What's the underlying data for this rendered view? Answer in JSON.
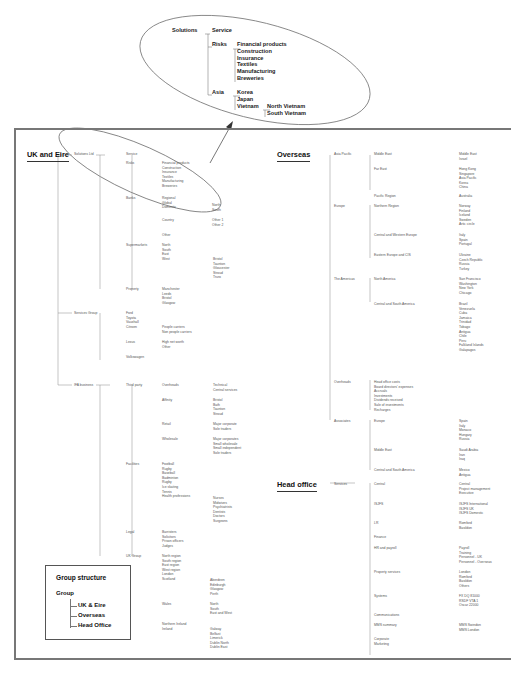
{
  "zoom_callout": {
    "root": "Solutions",
    "children": [
      {
        "label": "Service",
        "children": []
      },
      {
        "label": "Risks",
        "children": [
          "Financial products",
          "Construction",
          "Insurance",
          "Textiles",
          "Manufacturing",
          "Breweries"
        ]
      },
      {
        "label": "Asia",
        "children": [
          "Korea",
          "Japan",
          "Vietnam"
        ]
      }
    ],
    "vietnam_children": [
      "North Vietnam",
      "South Vietnam"
    ]
  },
  "uk": {
    "title": "UK and Eire",
    "l1": [
      "Solutions Ltd",
      "Services Group",
      "IFA business"
    ],
    "solutions": {
      "l2": [
        "Service",
        "Risks",
        "Banks",
        "Supermarkets",
        "Property"
      ],
      "risks": [
        "Financial products",
        "Construction",
        "Insurance",
        "Textiles",
        "Manufacturing",
        "Breweries"
      ],
      "banks_l3": [
        "Regional",
        "Global",
        "Domestic",
        "Country",
        "Other"
      ],
      "domestic": [
        "North",
        "South"
      ],
      "country": [
        "Other 1",
        "Other 2"
      ],
      "supermarkets": [
        "North",
        "South",
        "East",
        "West"
      ],
      "west": [
        "Bristol",
        "Taunton",
        "Gloucester",
        "Stroud",
        "Truro"
      ],
      "property": [
        "Manchester",
        "Leeds",
        "Bristol",
        "Glasgow"
      ]
    },
    "services_group": {
      "l2": [
        "Ford",
        "Toyota",
        "Vauxhall",
        "Citroen",
        "Lexus",
        "Volkswagen"
      ],
      "citroen": [
        "People carriers",
        "Non people carriers"
      ],
      "lexus": [
        "High net worth",
        "Other"
      ]
    },
    "ifa": {
      "l2": [
        "Third party",
        "Facilities",
        "Legal",
        "UK Group"
      ],
      "third_party": [
        "Overheads",
        "Affinity",
        "Retail",
        "Wholesale"
      ],
      "overheads": [
        "Technical",
        "Central services"
      ],
      "affinity": [
        "Bristol",
        "Bath",
        "Taunton",
        "Stroud"
      ],
      "retail": [
        "Major corporate",
        "Sole traders"
      ],
      "wholesale": [
        "Major corporates",
        "Small wholesale",
        "Small independent",
        "Sole traders"
      ],
      "facilities": [
        "Football",
        "Rugby",
        "Baseball",
        "Badminton",
        "Rugby",
        "Ice skating",
        "Tennis",
        "Health professions"
      ],
      "health": [
        "Nurses",
        "Midwives",
        "Psychiatrists",
        "Dentists",
        "Doctors",
        "Surgeons"
      ],
      "legal": [
        "Barristers",
        "Solicitors",
        "Prison officers",
        "Judges"
      ],
      "uk_group": [
        "North region",
        "South region",
        "East region",
        "West region",
        "London",
        "Scotland",
        "Wales",
        "Northern Ireland",
        "Ireland"
      ],
      "scotland": [
        "Aberdeen",
        "Edinburgh",
        "Glasgow",
        "Perth"
      ],
      "wales": [
        "North",
        "South",
        "East and West"
      ],
      "ireland": [
        "Galway",
        "Belfast",
        "Limerick",
        "Dublin North",
        "Dublin East"
      ]
    }
  },
  "overseas": {
    "title": "Overseas",
    "l1": [
      "Asia Pacific",
      "Europe",
      "The Americas",
      "Overheads",
      "Associates"
    ],
    "asia_pacific": {
      "l2": [
        "Middle East",
        "Far East",
        "Pacific Region"
      ],
      "middle_east": [
        "Middle East",
        "Israel"
      ],
      "far_east": [
        "Hong Kong",
        "Singapore",
        "Asia Pacific",
        "Korea",
        "China"
      ],
      "pacific": [
        "Australia"
      ]
    },
    "europe": {
      "l2": [
        "Northern Region",
        "Central and Western Europe",
        "Eastern Europe and CIS"
      ],
      "northern": [
        "Norway",
        "Finland",
        "Iceland",
        "Sweden",
        "Artic circle"
      ],
      "central": [
        "Italy",
        "Spain",
        "Portugal"
      ],
      "eastern": [
        "Ukraine",
        "Czech Republic",
        "Russia",
        "Turkey"
      ]
    },
    "americas": {
      "l2": [
        "North America",
        "Central and South America"
      ],
      "north": [
        "San Francisco",
        "Washington",
        "New York",
        "Chicago"
      ],
      "central_south": [
        "Brazil",
        "Venezuela",
        "Cuba",
        "Jamaica",
        "Trinidad",
        "Tobago",
        "Antigua",
        "Chile",
        "Peru",
        "Falkland Islands",
        "Galapagos"
      ]
    },
    "overheads": [
      "Head office costs",
      "Board directors' expenses",
      "Accruals",
      "Investments",
      "Dividends received",
      "Sale of investments",
      "Recharges"
    ],
    "associates": {
      "l2": [
        "Europe",
        "Middle East",
        "Central and South America"
      ],
      "europe": [
        "Spain",
        "Italy",
        "Monaco",
        "Hungary",
        "Russia"
      ],
      "middle_east": [
        "Saudi Arabia",
        "Iran",
        "Iraq"
      ],
      "csa": [
        "Mexico",
        "Antigua"
      ]
    }
  },
  "head_office": {
    "title": "Head office",
    "l1": [
      "Services"
    ],
    "l2": [
      "Central",
      "ISJFS",
      "LR",
      "Finance",
      "HR and payroll",
      "Property services",
      "Systems",
      "Communications",
      "MMS summary",
      "Corporate",
      "Marketing"
    ],
    "central": [
      "Central",
      "Project management",
      "Executive"
    ],
    "isjfs": [
      "ISJFS International",
      "ISJFS UK",
      "ISJFS Domestic"
    ],
    "lr": [
      "Romford",
      "Basildon"
    ],
    "hr": [
      "Payroll",
      "Training",
      "Personnel - UK",
      "Personnel - Overseas"
    ],
    "property": [
      "London",
      "Romford",
      "Basildon",
      "Others"
    ],
    "systems": [
      "FX DQ 81000",
      "RSDF VTA 1",
      "Oscar 22000"
    ],
    "mms": [
      "MMS Swindon",
      "MMS London"
    ]
  },
  "legend": {
    "title": "Group structure",
    "root": "Group",
    "items": [
      "UK & Eire",
      "Overseas",
      "Head Office"
    ]
  }
}
